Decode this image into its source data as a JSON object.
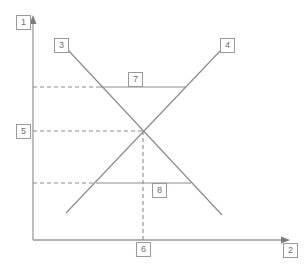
{
  "diagram": {
    "type": "supply-demand-graph",
    "background_color": "#ffffff",
    "line_color": "#8c8c8c",
    "axis_color": "#9a9a9a",
    "label_border_color": "#9a9a9a",
    "label_text_color": "#6f6f6f",
    "axes": {
      "y_axis_label": "1",
      "x_axis_label": "2",
      "y_axis_arrow": "arrow-up",
      "x_axis_arrow": "arrow-right"
    },
    "curves": [
      {
        "name": "downward-sloping-curve",
        "label": "3",
        "label_position": "top-left",
        "from": {
          "x": 68,
          "y": 50
        },
        "to": {
          "x": 222,
          "y": 215
        }
      },
      {
        "name": "upward-sloping-curve",
        "label": "4",
        "label_position": "top-right",
        "from": {
          "x": 66,
          "y": 213
        },
        "to": {
          "x": 221,
          "y": 50
        }
      }
    ],
    "horizontal_lines": [
      {
        "name": "upper-horizontal-line",
        "label": "7",
        "y": 87,
        "x_start": 100,
        "x_end": 186
      },
      {
        "name": "lower-horizontal-line",
        "label": "8",
        "y": 183,
        "x_start": 96,
        "x_end": 191
      }
    ],
    "dashed_guides": [
      {
        "name": "upper-price-guide",
        "orientation": "horizontal",
        "y": 87,
        "x_start": 33,
        "x_end": 100
      },
      {
        "name": "equilibrium-price-guide",
        "orientation": "horizontal",
        "y": 131,
        "x_start": 33,
        "x_end": 143,
        "label": "5"
      },
      {
        "name": "lower-price-guide",
        "orientation": "horizontal",
        "y": 183,
        "x_start": 33,
        "x_end": 96
      },
      {
        "name": "equilibrium-quantity-guide",
        "orientation": "vertical",
        "x": 143,
        "y_start": 131,
        "y_end": 240,
        "label": "6"
      }
    ],
    "equilibrium_point": {
      "x": 143,
      "y": 131
    },
    "labels": {
      "y_axis": "1",
      "x_axis": "2",
      "curve_down": "3",
      "curve_up": "4",
      "price_equilibrium": "5",
      "quantity_equilibrium": "6",
      "price_upper": "7",
      "price_lower": "8"
    }
  }
}
